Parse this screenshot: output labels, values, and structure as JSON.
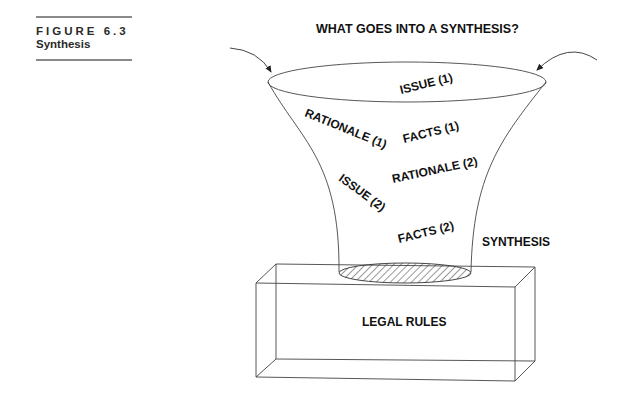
{
  "caption": {
    "figure_number": "FIGURE 6.3",
    "figure_title": "Synthesis"
  },
  "diagram": {
    "title": "WHAT GOES INTO A SYNTHESIS?",
    "funnel_items": [
      {
        "label": "ISSUE (1)"
      },
      {
        "label": "RATIONALE (1)"
      },
      {
        "label": "FACTS (1)"
      },
      {
        "label": "RATIONALE (2)"
      },
      {
        "label": "ISSUE (2)"
      },
      {
        "label": "FACTS (2)"
      }
    ],
    "output_label": "SYNTHESIS",
    "base_label": "LEGAL RULES"
  }
}
